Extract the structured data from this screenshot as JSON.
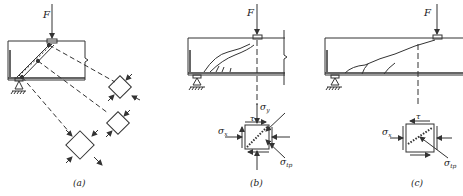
{
  "figure": {
    "panels": [
      {
        "id": "a",
        "caption": "(a)",
        "force_label": "F"
      },
      {
        "id": "b",
        "caption": "(b)",
        "force_label": "F",
        "stress_labels": {
          "sigma_y": "σ",
          "sigma_y_sub": "y",
          "tau": "τ",
          "sigma_x": "σ",
          "sigma_x_sub": "x",
          "sigma_tp": "σ",
          "sigma_tp_sub": "tp"
        }
      },
      {
        "id": "c",
        "caption": "(c)",
        "force_label": "F",
        "stress_labels": {
          "tau": "τ",
          "sigma_x": "σ",
          "sigma_x_sub": "x",
          "sigma_tp": "σ",
          "sigma_tp_sub": "tp"
        }
      }
    ],
    "colors": {
      "line": "#333333",
      "background": "#ffffff"
    }
  }
}
